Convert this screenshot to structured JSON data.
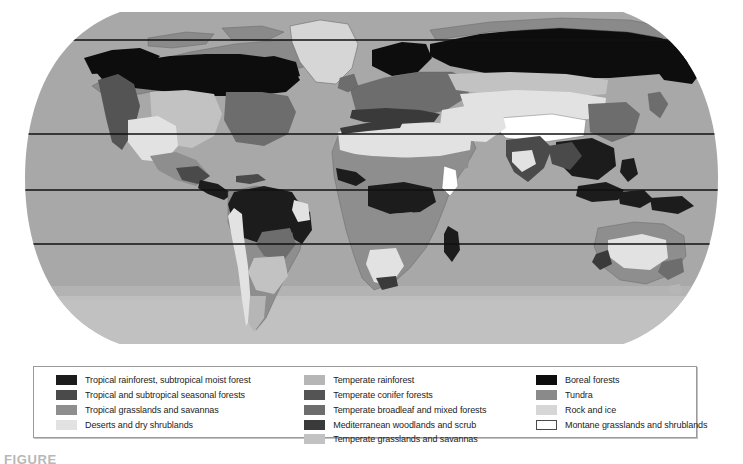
{
  "figure": {
    "caption_label": "FIGURE",
    "projection": "elliptical world projection",
    "latitude_line_color": "#111111",
    "ocean_color": "#a8a8a8"
  },
  "palette": {
    "tropical_rainforest": "#1c1c1c",
    "tropical_seasonal_forest": "#4a4a4a",
    "tropical_grasslands": "#8e8e8e",
    "deserts": "#e2e2e2",
    "temperate_rainforest": "#b6b6b6",
    "temperate_conifer": "#545454",
    "temperate_broadleaf": "#6d6d6d",
    "mediterranean": "#3a3a3a",
    "temperate_grasslands": "#c2c2c2",
    "boreal_forests": "#0d0d0d",
    "tundra": "#8a8a8a",
    "rock_and_ice": "#d6d6d6",
    "montane": "#ffffff",
    "ocean": "#a8a8a8",
    "outline": "#5e5e5e"
  },
  "legend": {
    "columns": [
      {
        "items": [
          {
            "label": "Tropical rainforest, subtropical moist forest",
            "color": "#1c1c1c",
            "outlined": false
          },
          {
            "label": "Tropical and subtropical seasonal forests",
            "color": "#4a4a4a",
            "outlined": false
          },
          {
            "label": "Tropical grasslands and savannas",
            "color": "#8e8e8e",
            "outlined": false
          },
          {
            "label": "Deserts and dry shrublands",
            "color": "#e2e2e2",
            "outlined": false
          }
        ]
      },
      {
        "items": [
          {
            "label": "Temperate rainforest",
            "color": "#b6b6b6",
            "outlined": false
          },
          {
            "label": "Temperate conifer forests",
            "color": "#545454",
            "outlined": false
          },
          {
            "label": "Temperate broadleaf and mixed forests",
            "color": "#6d6d6d",
            "outlined": false
          },
          {
            "label": "Mediterranean woodlands and scrub",
            "color": "#3a3a3a",
            "outlined": false
          },
          {
            "label": "Temperate grasslands and savannas",
            "color": "#c2c2c2",
            "outlined": false
          }
        ]
      },
      {
        "items": [
          {
            "label": "Boreal forests",
            "color": "#0d0d0d",
            "outlined": false
          },
          {
            "label": "Tundra",
            "color": "#8a8a8a",
            "outlined": false
          },
          {
            "label": "Rock and ice",
            "color": "#d6d6d6",
            "outlined": false
          },
          {
            "label": "Montane grasslands and shrublands",
            "color": "#ffffff",
            "outlined": true
          }
        ]
      }
    ]
  },
  "map": {
    "latitude_lines_y": [
      40,
      134,
      190,
      244
    ]
  }
}
